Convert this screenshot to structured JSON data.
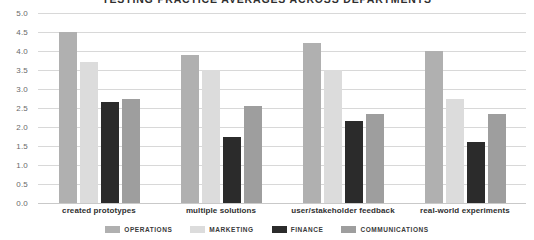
{
  "chart_data": {
    "type": "bar",
    "title": "TESTING PRACTICE AVERAGES ACROSS DEPARTMENTS",
    "xlabel": "",
    "ylabel": "",
    "ylim": [
      0.0,
      5.0
    ],
    "ytick_step": 0.5,
    "grid": true,
    "legend_position": "bottom",
    "categories": [
      "created prototypes",
      "multiple solutions",
      "user/stakeholder feedback",
      "real-world experiments"
    ],
    "series": [
      {
        "name": "OPERATIONS",
        "color": "#b0b0b0",
        "values": [
          4.5,
          3.9,
          4.2,
          4.0
        ]
      },
      {
        "name": "MARKETING",
        "color": "#dcdcdc",
        "values": [
          3.7,
          3.5,
          3.5,
          2.75
        ]
      },
      {
        "name": "FINANCE",
        "color": "#2b2b2b",
        "values": [
          2.65,
          1.75,
          2.15,
          1.6
        ]
      },
      {
        "name": "COMMUNICATIONS",
        "color": "#9e9e9e",
        "values": [
          2.75,
          2.55,
          2.35,
          2.35
        ]
      }
    ],
    "ytick_labels": [
      "0.0",
      "0.5",
      "1.0",
      "1.5",
      "2.0",
      "2.5",
      "3.0",
      "3.5",
      "4.0",
      "4.5",
      "5.0"
    ]
  },
  "style": {
    "gridline_color": "#d8d8d8",
    "text_color": "#2f2f2f",
    "tick_color": "#6a6a6a",
    "background": "#ffffff"
  }
}
